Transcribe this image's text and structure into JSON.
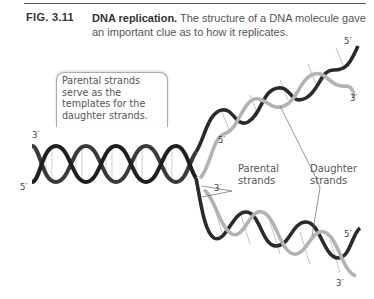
{
  "figure": {
    "number": "FIG. 3.11",
    "title": "DNA replication.",
    "caption": " The structure of a DNA molecule gave an important clue as to how it replicates."
  },
  "callout": {
    "text": "Parental strands serve as the templates for the daughter strands."
  },
  "end_labels": {
    "left_top": "3′",
    "left_bottom": "5′",
    "upper_branch_top": "5′",
    "upper_branch_right": "3′",
    "upper_branch_inner": "5′",
    "lower_branch_inner": "3′",
    "lower_branch_right": "5′",
    "lower_branch_bottom": "3′"
  },
  "labels": {
    "parental": "Parental strands",
    "parental_line1": "Parental",
    "parental_line2": "strands",
    "daughter_line1": "Daughter",
    "daughter_line2": "strands"
  },
  "colors": {
    "parental_strand": "#2b2b2b",
    "daughter_strand": "#b5b5b5",
    "base_pairs": "#9a9a9a",
    "caption_text": "#555555"
  }
}
